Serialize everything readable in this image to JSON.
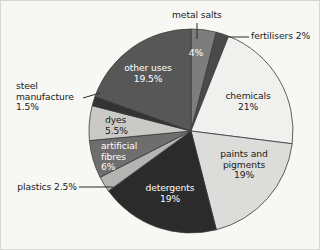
{
  "chart_data": {
    "type": "pie",
    "title": "",
    "subtitle": "",
    "xlabel": "",
    "ylabel": "",
    "legend_position": "none",
    "grid": false,
    "units": "percent",
    "total": 100,
    "start_angle_deg": 0,
    "direction": "clockwise",
    "categories": [
      "metal salts",
      "fertilisers",
      "chemicals",
      "paints and pigments",
      "detergents",
      "plastics",
      "artificial fibres",
      "dyes",
      "steel manufacture",
      "other uses"
    ],
    "values": [
      4,
      2,
      21,
      19,
      19,
      2.5,
      6,
      5.5,
      1.5,
      19.5
    ],
    "slices": [
      {
        "name": "metal salts",
        "value": 4,
        "value_label": "4%",
        "color": "#7d7d7d",
        "label_placement": "inside",
        "label_color": "light"
      },
      {
        "name": "fertilisers",
        "value": 2,
        "value_label": "2%",
        "color": "#4a4a4a",
        "label_placement": "callout",
        "label_color": "dark"
      },
      {
        "name": "chemicals",
        "value": 21,
        "value_label": "21%",
        "color": "#f0f0ee",
        "label_placement": "inside",
        "label_color": "dark"
      },
      {
        "name": "paints and pigments",
        "value": 19,
        "value_label": "19%",
        "color": "#dcdcda",
        "label_placement": "inside",
        "label_color": "dark"
      },
      {
        "name": "detergents",
        "value": 19,
        "value_label": "19%",
        "color": "#2b2b2b",
        "label_placement": "inside",
        "label_color": "light"
      },
      {
        "name": "plastics",
        "value": 2.5,
        "value_label": "2.5%",
        "color": "#b4b4b2",
        "label_placement": "callout",
        "label_color": "dark"
      },
      {
        "name": "artificial fibres",
        "value": 6,
        "value_label": "6%",
        "color": "#6e6e6e",
        "label_placement": "inside",
        "label_color": "light"
      },
      {
        "name": "dyes",
        "value": 5.5,
        "value_label": "5.5%",
        "color": "#c9c9c6",
        "label_placement": "inside",
        "label_color": "dark"
      },
      {
        "name": "steel manufacture",
        "value": 1.5,
        "value_label": "1.5%",
        "color": "#333333",
        "label_placement": "callout",
        "label_color": "dark"
      },
      {
        "name": "other uses",
        "value": 19.5,
        "value_label": "19.5%",
        "color": "#575757",
        "label_placement": "inside",
        "label_color": "light"
      }
    ]
  },
  "labels": {
    "metal_salts": {
      "name": "metal salts",
      "value": "4%"
    },
    "fertilisers": {
      "text": "fertilisers 2%"
    },
    "chemicals": {
      "name": "chemicals",
      "value": "21%"
    },
    "paints": {
      "line1": "paints and",
      "line2": "pigments",
      "value": "19%"
    },
    "detergents": {
      "name": "detergents",
      "value": "19%"
    },
    "plastics": {
      "text": "plastics 2.5%"
    },
    "artificial_fibres": {
      "line1": "artificial",
      "line2": "fibres",
      "value": "6%"
    },
    "dyes": {
      "name": "dyes",
      "value": "5.5%"
    },
    "steel": {
      "line1": "steel",
      "line2": "manufacture",
      "value": "1.5%"
    },
    "other_uses": {
      "name": "other uses",
      "value": "19.5%"
    }
  },
  "style": {
    "background": "#f7f7f4",
    "border": "#d8d8d2",
    "slice_stroke": "#3a3a3a",
    "leader_line": "#2a2a2a"
  }
}
